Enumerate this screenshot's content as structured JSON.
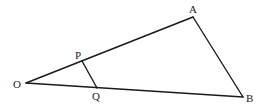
{
  "diagram": {
    "type": "geometry",
    "points": [
      {
        "id": "O",
        "label": "O",
        "x": 26,
        "y": 83,
        "lx": 13,
        "ly": 88
      },
      {
        "id": "A",
        "label": "A",
        "x": 193,
        "y": 17,
        "lx": 189,
        "ly": 13
      },
      {
        "id": "B",
        "label": "B",
        "x": 243,
        "y": 97,
        "lx": 246,
        "ly": 102
      },
      {
        "id": "P",
        "label": "P",
        "x": 82,
        "y": 61,
        "lx": 75,
        "ly": 59
      },
      {
        "id": "Q",
        "label": "Q",
        "x": 97,
        "y": 88,
        "lx": 92,
        "ly": 100
      }
    ],
    "segments": [
      {
        "from": "O",
        "to": "A"
      },
      {
        "from": "A",
        "to": "B"
      },
      {
        "from": "O",
        "to": "B"
      },
      {
        "from": "P",
        "to": "Q"
      }
    ]
  }
}
